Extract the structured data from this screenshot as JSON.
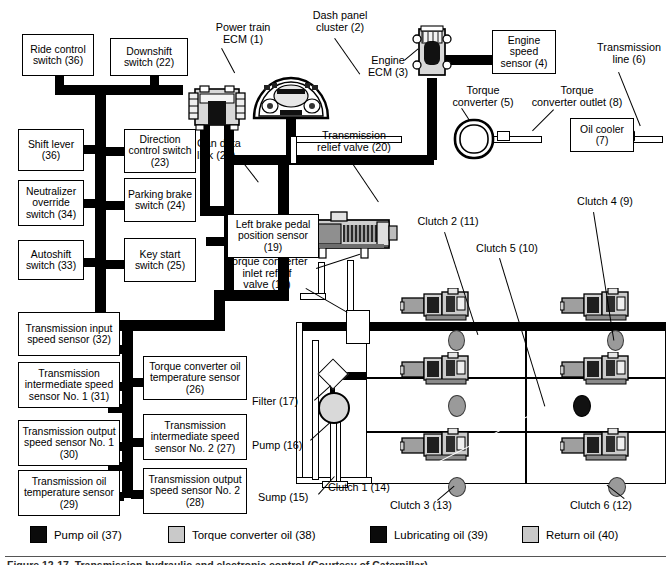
{
  "figure": {
    "caption": "Figure 12-17. Transmission hydraulic and electronic control (Courtesy of Caterpillar)."
  },
  "left_switch_boxes": [
    {
      "id": "ride-control-switch",
      "label": "Ride\ncontrol\nswitch (36)"
    },
    {
      "id": "downshift-switch",
      "label": "Downshift\nswitch (22)"
    },
    {
      "id": "shift-lever",
      "label": "Shift\nlever (36)"
    },
    {
      "id": "direction-control-switch",
      "label": "Direction\ncontrol\nswitch (23)"
    },
    {
      "id": "neutralizer-override-switch",
      "label": "Neutralizer\noverride\nswitch (34)"
    },
    {
      "id": "parking-brake-switch",
      "label": "Parking\nbrake\nswitch (24)"
    },
    {
      "id": "autoshift-switch",
      "label": "Autoshift\nswitch (33)"
    },
    {
      "id": "key-start-switch",
      "label": "Key\nstart\nswitch (25)"
    }
  ],
  "sensor_boxes": [
    {
      "id": "transmission-input-speed-sensor",
      "label": "Transmission\ninput speed\nsensor (32)"
    },
    {
      "id": "transmission-intermediate-speed-sensor-1",
      "label": "Transmission\nintermediate speed\nsensor No. 1 (31)"
    },
    {
      "id": "transmission-output-speed-sensor-1",
      "label": "Transmission\noutput speed\nsensor No. 1 (30)"
    },
    {
      "id": "transmission-oil-temperature-sensor",
      "label": "Transmission\noil temperature\nsensor (29)"
    },
    {
      "id": "torque-converter-oil-temperature-sensor",
      "label": "Torque converter\noil temperature\nsensor (26)"
    },
    {
      "id": "transmission-intermediate-speed-sensor-2",
      "label": "Transmission\nintermediate speed\nsensor No. 2 (27)"
    },
    {
      "id": "transmission-output-speed-sensor-2",
      "label": "Transmission\noutput speed\nsensor No. 2 (28)"
    }
  ],
  "other_boxes": [
    {
      "id": "left-brake-pedal-position-sensor",
      "label": "Left brake\npedal position\nsensor (19)"
    },
    {
      "id": "engine-speed-sensor",
      "label": "Engine\nspeed\nsensor (4)"
    },
    {
      "id": "oil-cooler",
      "label": "Oil\ncooler (7)"
    }
  ],
  "callouts": [
    {
      "id": "power-train-ecm",
      "label": "Power train\nECM (1)"
    },
    {
      "id": "dash-panel-cluster",
      "label": "Dash panel\ncluster (2)"
    },
    {
      "id": "engine-ecm",
      "label": "Engine\nECM (3)"
    },
    {
      "id": "torque-converter",
      "label": "Torque\nconverter (5)"
    },
    {
      "id": "torque-converter-outlet",
      "label": "Torque\nconverter outlet (8)"
    },
    {
      "id": "transmission-line",
      "label": "Transmission\nline (6)"
    },
    {
      "id": "can-data-link",
      "label": "Can data\nlink (21)"
    },
    {
      "id": "transmission-relief-valve",
      "label": "Transmission\nrelief valve (20)"
    },
    {
      "id": "torque-converter-inlet-relief-valve",
      "label": "Torque converter\ninlet reflief\nvalve (18)"
    },
    {
      "id": "filter",
      "label": "Filter (17)"
    },
    {
      "id": "pump",
      "label": "Pump (16)"
    },
    {
      "id": "sump",
      "label": "Sump (15)"
    },
    {
      "id": "clutch-2",
      "label": "Clutch 2 (11)"
    },
    {
      "id": "clutch-5",
      "label": "Clutch 5 (10)"
    },
    {
      "id": "clutch-4",
      "label": "Clutch 4 (9)"
    },
    {
      "id": "clutch-1",
      "label": "Clutch 1 (14)"
    },
    {
      "id": "clutch-3",
      "label": "Clutch 3 (13)"
    },
    {
      "id": "clutch-6",
      "label": "Clutch 6 (12)"
    }
  ],
  "legend": {
    "items": [
      {
        "id": "pump-oil",
        "label": "Pump oil (37)",
        "swatch": "black",
        "color": "#0b0b0b"
      },
      {
        "id": "torque-converter-oil",
        "label": "Torque converter oil (38)",
        "swatch": "lgray",
        "color": "#c9c9c9"
      },
      {
        "id": "lubricating-oil",
        "label": "Lubricating oil (39)",
        "swatch": "black",
        "color": "#0b0b0b"
      },
      {
        "id": "return-oil",
        "label": "Return oil (40)",
        "swatch": "lgray",
        "color": "#c9c9c9"
      }
    ]
  }
}
